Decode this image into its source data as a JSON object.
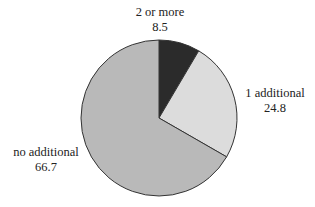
{
  "chart_data": {
    "type": "pie",
    "title": "",
    "slices": [
      {
        "label": "2 or more",
        "value": 8.5,
        "color": "#2b2b2b"
      },
      {
        "label": "1 additional",
        "value": 24.8,
        "color": "#dcdcdc"
      },
      {
        "label": "no additional",
        "value": 66.7,
        "color": "#b9b9b9"
      }
    ],
    "start_angle_deg": 0,
    "direction": "clockwise",
    "legend": "none",
    "labels_outside": true
  },
  "labels": {
    "two_or_more": {
      "name": "2 or more",
      "value": "8.5"
    },
    "one_additional": {
      "name": "1 additional",
      "value": "24.8"
    },
    "no_additional": {
      "name": "no additional",
      "value": "66.7"
    }
  }
}
